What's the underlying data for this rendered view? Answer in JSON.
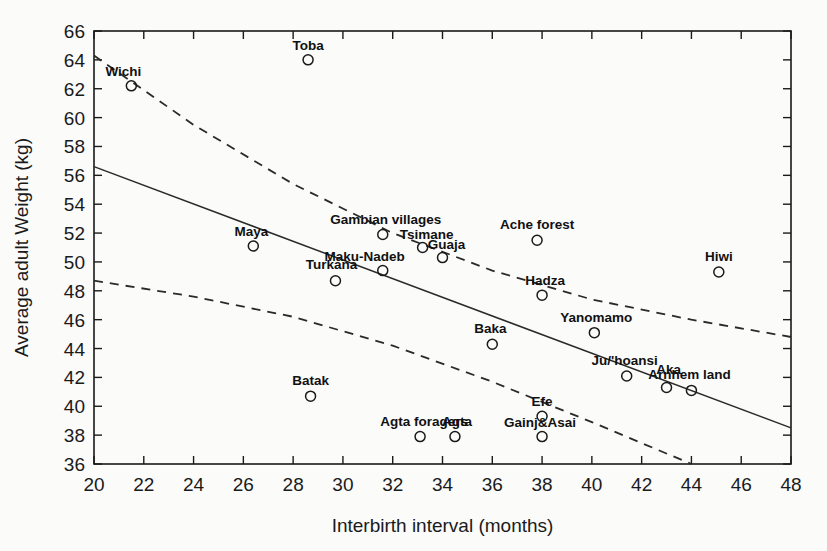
{
  "chart_data": {
    "type": "scatter",
    "title": "",
    "xlabel": "Interbirth interval (months)",
    "ylabel": "Average adult Weight (kg)",
    "xlim": [
      20,
      48
    ],
    "ylim": [
      36,
      66
    ],
    "xticks": [
      20,
      22,
      24,
      26,
      28,
      30,
      32,
      34,
      36,
      38,
      40,
      42,
      44,
      46,
      48
    ],
    "yticks": [
      36,
      38,
      40,
      42,
      44,
      46,
      48,
      50,
      52,
      54,
      56,
      58,
      60,
      62,
      64,
      66
    ],
    "grid": false,
    "legend": "none",
    "points": [
      {
        "label": "Wichi",
        "x": 21.5,
        "y": 62.2,
        "label_dx": -8,
        "label_dy": -10,
        "anchor": "middle"
      },
      {
        "label": "Toba",
        "x": 28.6,
        "y": 64.0,
        "label_dx": 0,
        "label_dy": -10,
        "anchor": "middle"
      },
      {
        "label": "Maya",
        "x": 26.4,
        "y": 51.1,
        "label_dx": -2,
        "label_dy": -10,
        "anchor": "middle"
      },
      {
        "label": "Gambian villages",
        "x": 31.6,
        "y": 51.9,
        "label_dx": 3,
        "label_dy": -11,
        "anchor": "middle"
      },
      {
        "label": "Tsimane",
        "x": 33.2,
        "y": 51.0,
        "label_dx": 4,
        "label_dy": -9,
        "anchor": "middle"
      },
      {
        "label": "Guaja",
        "x": 34.0,
        "y": 50.3,
        "label_dx": 4,
        "label_dy": -9,
        "anchor": "middle"
      },
      {
        "label": "Maku-Nadeb",
        "x": 31.6,
        "y": 49.4,
        "label_dx": -18,
        "label_dy": -10,
        "anchor": "middle"
      },
      {
        "label": "Turkana",
        "x": 29.7,
        "y": 48.7,
        "label_dx": -4,
        "label_dy": -12,
        "anchor": "middle"
      },
      {
        "label": "Ache forest",
        "x": 37.8,
        "y": 51.5,
        "label_dx": 0,
        "label_dy": -11,
        "anchor": "middle"
      },
      {
        "label": "Hiwi",
        "x": 45.1,
        "y": 49.3,
        "label_dx": 0,
        "label_dy": -11,
        "anchor": "middle"
      },
      {
        "label": "Hadza",
        "x": 38.0,
        "y": 47.7,
        "label_dx": 3,
        "label_dy": -10,
        "anchor": "middle"
      },
      {
        "label": "Yanomamo",
        "x": 40.1,
        "y": 45.1,
        "label_dx": 2,
        "label_dy": -11,
        "anchor": "middle"
      },
      {
        "label": "Baka",
        "x": 36.0,
        "y": 44.3,
        "label_dx": -2,
        "label_dy": -11,
        "anchor": "middle"
      },
      {
        "label": "Ju/'hoansi",
        "x": 41.4,
        "y": 42.1,
        "label_dx": -2,
        "label_dy": -11,
        "anchor": "middle"
      },
      {
        "label": "Aka",
        "x": 43.0,
        "y": 41.3,
        "label_dx": 2,
        "label_dy": -14,
        "anchor": "middle"
      },
      {
        "label": "Arnhem land",
        "x": 44.0,
        "y": 41.1,
        "label_dx": -2,
        "label_dy": -11,
        "anchor": "middle"
      },
      {
        "label": "Batak",
        "x": 28.7,
        "y": 40.7,
        "label_dx": 0,
        "label_dy": -11,
        "anchor": "middle"
      },
      {
        "label": "Efe",
        "x": 38.0,
        "y": 39.3,
        "label_dx": 0,
        "label_dy": -10,
        "anchor": "middle"
      },
      {
        "label": "Gainj&Asai",
        "x": 38.0,
        "y": 37.9,
        "label_dx": -2,
        "label_dy": -10,
        "anchor": "middle"
      },
      {
        "label": "Agta foragers",
        "x": 33.1,
        "y": 37.9,
        "label_dx": 4,
        "label_dy": -11,
        "anchor": "middle"
      },
      {
        "label": "Agta",
        "x": 34.5,
        "y": 37.9,
        "label_dx": 2,
        "label_dy": -11,
        "anchor": "middle"
      }
    ],
    "fit_line": {
      "name": "regression",
      "style": "solid",
      "x": [
        20,
        48
      ],
      "y": [
        56.6,
        38.5
      ]
    },
    "confidence_bands": [
      {
        "name": "upper-confidence-band",
        "style": "dashed",
        "x": [
          20,
          24,
          28,
          32,
          36,
          40,
          44,
          48
        ],
        "y": [
          64.3,
          59.5,
          55.4,
          52.0,
          49.4,
          47.4,
          46.0,
          44.8
        ]
      },
      {
        "name": "lower-confidence-band",
        "style": "dashed",
        "x": [
          20,
          24,
          28,
          32,
          36,
          40,
          44
        ],
        "y": [
          48.7,
          47.6,
          46.2,
          44.2,
          41.7,
          38.9,
          36.0
        ]
      }
    ]
  }
}
